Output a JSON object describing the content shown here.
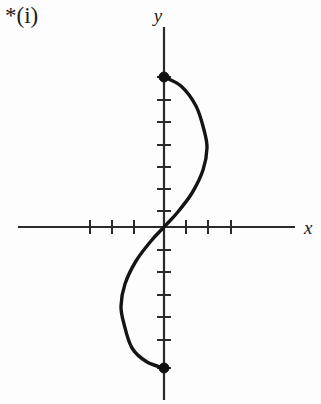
{
  "figure": {
    "part_label": "*(i)",
    "background_color": "#fdfdfd",
    "ink_color": "#141414",
    "axis_color": "#2b2b2b",
    "x_axis_label": "x",
    "y_axis_label": "y"
  },
  "chart_data": {
    "type": "line",
    "title": "",
    "subtitle": "",
    "xlabel": "x",
    "ylabel": "y",
    "grid": false,
    "legend": null,
    "axis_style": "cartesian-cross-unlabelled-ticks",
    "origin_px": {
      "x": 164,
      "y": 227
    },
    "unit_px": 22.3,
    "x_axis_px": {
      "start": 18,
      "end": 295,
      "y": 227
    },
    "y_axis_px": {
      "start": 27,
      "end": 400,
      "x": 164
    },
    "xlim": [
      -6.5,
      5.9
    ],
    "ylim": [
      -7.8,
      9.0
    ],
    "x_tick_units": [
      -3,
      -2,
      -1,
      1,
      2,
      3
    ],
    "y_tick_units": [
      -5,
      -4,
      -3,
      -2,
      -1,
      1,
      2,
      3,
      4,
      5,
      6
    ],
    "x_ticks_px": [
      90,
      112,
      134,
      186,
      208,
      231
    ],
    "y_ticks_px": [
      100,
      122,
      145,
      167,
      189,
      211,
      250,
      272,
      295,
      317,
      340
    ],
    "tick_half_length_px": 7,
    "series": [
      {
        "name": "cubic-s-curve",
        "description": "Smooth S-shaped cubic-like curve from top endpoint on the y-axis, bulging right into the first quadrant, passing through the origin with steep positive slope, bulging left into the third quadrant, down to the bottom endpoint on the y-axis.",
        "stroke_width_px": 3.4,
        "points_px": [
          {
            "x": 164,
            "y": 77
          },
          {
            "x": 181,
            "y": 86
          },
          {
            "x": 196,
            "y": 106
          },
          {
            "x": 204,
            "y": 130
          },
          {
            "x": 207,
            "y": 148
          },
          {
            "x": 203,
            "y": 170
          },
          {
            "x": 192,
            "y": 193
          },
          {
            "x": 177,
            "y": 213
          },
          {
            "x": 164,
            "y": 227
          },
          {
            "x": 151,
            "y": 241
          },
          {
            "x": 136,
            "y": 261
          },
          {
            "x": 125,
            "y": 284
          },
          {
            "x": 121,
            "y": 306
          },
          {
            "x": 124,
            "y": 324
          },
          {
            "x": 132,
            "y": 348
          },
          {
            "x": 147,
            "y": 362
          },
          {
            "x": 164,
            "y": 368
          }
        ],
        "endpoints": [
          {
            "x_px": 164,
            "y_px": 77,
            "marker": "filled-dot",
            "on_axis": "y",
            "units": {
              "x": 0,
              "y": 6.7
            }
          },
          {
            "x_px": 164,
            "y_px": 368,
            "marker": "filled-dot",
            "on_axis": "y",
            "units": {
              "x": 0,
              "y": -6.3
            }
          }
        ],
        "inflection_px": {
          "x": 164,
          "y": 227
        },
        "max_right_px": {
          "x": 207,
          "y": 148
        },
        "max_left_px": {
          "x": 121,
          "y": 306
        },
        "symmetry": "odd (rotationally symmetric about the origin)"
      }
    ],
    "annotations": [
      {
        "text": "*(i)",
        "x_px": 5,
        "y_px": 14,
        "role": "part-label"
      },
      {
        "text": "y",
        "x_px": 164,
        "y_px": 16,
        "role": "axis-label",
        "style": "italic"
      },
      {
        "text": "x",
        "x_px": 306,
        "y_px": 229,
        "role": "axis-label",
        "style": "italic"
      }
    ]
  }
}
